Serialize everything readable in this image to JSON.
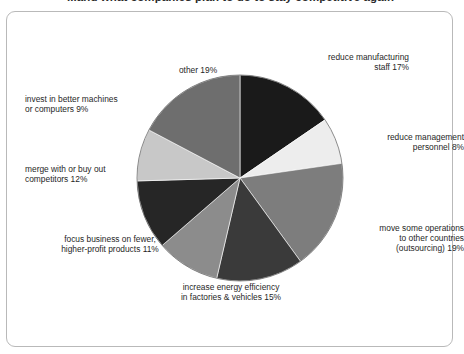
{
  "figure": {
    "title": "...and what companies plan to do to stay competitive again",
    "panel_border_color": "#b9b9b9"
  },
  "chart_data": {
    "type": "pie",
    "title": "...and what companies plan to do to stay competitive again",
    "xlabel": "",
    "ylabel": "",
    "legend": "labels-around-slices",
    "grid": false,
    "start_angle_deg": 0,
    "direction": "clockwise",
    "categories": [
      "reduce manufacturing staff",
      "reduce management personnel",
      "move some operations to other countries (outsourcing)",
      "increase energy efficiency in factories & vehicles",
      "focus business on fewer, higher-profit products",
      "merge with or buy out competitors",
      "invest in better machines or computers",
      "other"
    ],
    "values": [
      17,
      8,
      19,
      15,
      11,
      12,
      9,
      19
    ],
    "colors": [
      "#1a1a1a",
      "#ededed",
      "#7d7d7d",
      "#3a3a3a",
      "#8c8c8c",
      "#262626",
      "#c8c8c8",
      "#6e6e6e"
    ],
    "slices": [
      {
        "label": "reduce manufacturing\nstaff 17%",
        "name": "reduce manufacturing staff",
        "value": 17,
        "percent_text": "17%",
        "color": "#1a1a1a"
      },
      {
        "label": "reduce management\npersonnel 8%",
        "name": "reduce management personnel",
        "value": 8,
        "percent_text": "8%",
        "color": "#ededed"
      },
      {
        "label": "move some operations\nto other countries\n(outsourcing) 19%",
        "name": "move some operations to other countries (outsourcing)",
        "value": 19,
        "percent_text": "19%",
        "color": "#7d7d7d"
      },
      {
        "label": "increase energy efficiency\nin factories & vehicles 15%",
        "name": "increase energy efficiency in factories & vehicles",
        "value": 15,
        "percent_text": "15%",
        "color": "#3a3a3a"
      },
      {
        "label": "focus business on fewer,\nhigher-profit products 11%",
        "name": "focus business on fewer, higher-profit products",
        "value": 11,
        "percent_text": "11%",
        "color": "#8c8c8c"
      },
      {
        "label": "merge with or buy out\ncompetitors 12%",
        "name": "merge with or buy out competitors",
        "value": 12,
        "percent_text": "12%",
        "color": "#262626"
      },
      {
        "label": "invest in better machines\nor computers 9%",
        "name": "invest in better machines or computers",
        "value": 9,
        "percent_text": "9%",
        "color": "#c8c8c8"
      },
      {
        "label": "other 19%",
        "name": "other",
        "value": 19,
        "percent_text": "19%",
        "color": "#6e6e6e"
      }
    ]
  }
}
